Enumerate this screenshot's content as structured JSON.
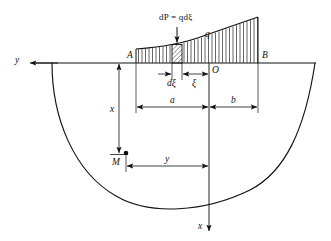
{
  "figure": {
    "type": "engineering-diagram",
    "colors": {
      "line": "#111111",
      "hatch": "#444444",
      "background": "#ffffff"
    },
    "labels": {
      "load_equation": "dP = qdξ",
      "load_intensity": "q",
      "point_a": "A",
      "point_b": "B",
      "origin": "O",
      "point_m": "M",
      "elem_width": "dξ",
      "elem_offset": "ξ",
      "dim_a": "a",
      "dim_b": "b",
      "dim_x": "x",
      "dim_y": "y",
      "axis_y": "y",
      "axis_x": "x"
    },
    "geometry": {
      "baseline_y": 63,
      "baseline_x_start": 33,
      "baseline_x_end": 316,
      "origin_x": 209,
      "point_a_x": 136,
      "point_b_x": 258,
      "strip_left_x": 172,
      "strip_right_x": 182,
      "load_peak_height": 34,
      "load_left_height": 14,
      "point_m_x": 119,
      "point_m_y": 156,
      "axis_x_bottom": 232,
      "axis_y_left": 33
    }
  }
}
